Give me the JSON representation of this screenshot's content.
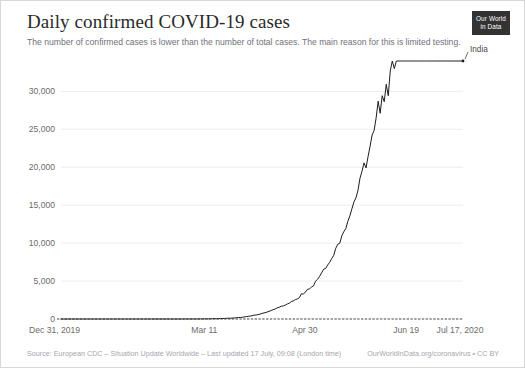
{
  "header": {
    "title": "Daily confirmed COVID-19 cases",
    "subtitle": "The number of confirmed cases is lower than the number of total cases. The main reason for this is limited testing.",
    "logo_line1": "Our World",
    "logo_line2": "in Data"
  },
  "footer": {
    "source": "Source: European CDC – Situation Update Worldwide – Last updated 17 July, 09:08 (London time)",
    "credit": "OurWorldInData.org/coronavirus • CC BY"
  },
  "colors": {
    "line": "#1d1d1d",
    "grid": "#ededed",
    "text_muted": "#6b6b6b",
    "title": "#2a2a2a",
    "subtitle": "#72707b",
    "footer": "#a7a5ad",
    "logo_bg": "#333333"
  },
  "chart_data": {
    "type": "line",
    "title": "Daily confirmed COVID-19 cases",
    "subtitle": "The number of confirmed cases is lower than the number of total cases. The main reason for this is limited testing.",
    "xlabel": "",
    "ylabel": "",
    "grid": true,
    "legend_position": "end-of-line",
    "ylim": [
      0,
      34000
    ],
    "yticks": [
      0,
      5000,
      10000,
      15000,
      20000,
      25000,
      30000
    ],
    "ytick_labels": [
      "0",
      "5,000",
      "10,000",
      "15,000",
      "20,000",
      "25,000",
      "30,000"
    ],
    "xlim_labels": [
      "Dec 31, 2019",
      "Jul 17, 2020"
    ],
    "xticks": [
      0,
      71,
      121,
      171,
      199
    ],
    "xtick_labels": [
      "Dec 31, 2019",
      "Mar 11",
      "Apr 30",
      "Jun 19",
      "Jul 17, 2020"
    ],
    "series": [
      {
        "name": "India",
        "color": "#1d1d1d",
        "x_start_date": "Dec 31, 2019",
        "x_end_date": "Jul 17, 2020",
        "n_points": 200,
        "values": [
          0,
          0,
          0,
          0,
          0,
          0,
          0,
          0,
          0,
          0,
          0,
          0,
          0,
          0,
          0,
          0,
          0,
          0,
          0,
          0,
          0,
          0,
          0,
          0,
          0,
          0,
          0,
          0,
          0,
          1,
          0,
          0,
          0,
          1,
          0,
          0,
          0,
          0,
          0,
          0,
          0,
          0,
          0,
          0,
          0,
          0,
          0,
          0,
          0,
          0,
          0,
          0,
          0,
          0,
          0,
          0,
          0,
          0,
          1,
          2,
          0,
          2,
          1,
          5,
          3,
          4,
          3,
          8,
          6,
          12,
          9,
          15,
          22,
          17,
          28,
          40,
          46,
          34,
          53,
          60,
          75,
          70,
          95,
          108,
          97,
          130,
          146,
          167,
          192,
          205,
          240,
          284,
          312,
          354,
          400,
          468,
          521,
          540,
          601,
          693,
          773,
          826,
          909,
          1007,
          1118,
          1229,
          1320,
          1463,
          1540,
          1685,
          1718,
          1834,
          1975,
          2074,
          2293,
          2388,
          2553,
          2644,
          2806,
          3320,
          3277,
          3561,
          3900,
          3970,
          4213,
          4353,
          4970,
          5242,
          5609,
          6088,
          6566,
          6654,
          7113,
          7466,
          7964,
          8380,
          9304,
          9851,
          9987,
          10956,
          11502,
          11929,
          12881,
          13586,
          14516,
          15413,
          15968,
          16922,
          18552,
          19459,
          20572,
          19906,
          21400,
          22771,
          24248,
          24850,
          26506,
          28701,
          27114,
          29429,
          28637,
          30934,
          29429,
          32695,
          34956,
          33000,
          36000,
          38000,
          36000,
          40000,
          42000,
          44000,
          42000,
          46000,
          48000,
          50000,
          49000,
          52000,
          54000,
          56000,
          58000,
          57000,
          60000,
          62000,
          64000,
          66000,
          68000,
          67000,
          70000,
          72000,
          74000,
          76000,
          78000,
          80000,
          82000,
          84000,
          86000,
          88000,
          90000,
          92000
        ],
        "plotted_series_peak": 34000,
        "plotted_series_peak_label": "≈34,000 (Jul 17, 2020)"
      }
    ]
  }
}
